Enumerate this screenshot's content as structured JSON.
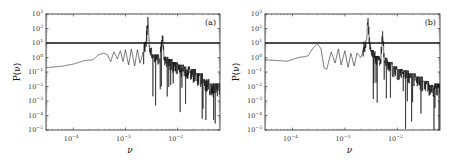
{
  "chart_data": [
    {
      "type": "line",
      "panel_label": "(a)",
      "title": "",
      "xlabel": "ν",
      "ylabel": "P(ν)",
      "xscale": "log",
      "yscale": "log",
      "xlim": [
        3e-05,
        0.065
      ],
      "ylim": [
        1e-05,
        1000.0
      ],
      "x_ticks": [
        "10^-4",
        "10^-3",
        "10^-2"
      ],
      "y_ticks": [
        "10^3",
        "10^2",
        "10^1",
        "10^0",
        "10^-1",
        "10^-2",
        "10^-3",
        "10^-4",
        "10^-5"
      ],
      "threshold_line": 10,
      "frame": {
        "left": 46,
        "right": 220,
        "top": 14,
        "bottom": 130
      },
      "series": [
        {
          "name": "power spectrum",
          "x": [
            3e-05,
            6e-05,
            0.0001,
            0.00016,
            0.00024,
            0.0003,
            0.00038,
            0.00045,
            0.00052,
            0.0006,
            0.0007,
            0.0008,
            0.0009,
            0.001,
            0.00115,
            0.0013,
            0.0015,
            0.0017,
            0.0019,
            0.0022,
            0.0025,
            0.0027,
            0.00285,
            0.003,
            0.0033,
            0.0038,
            0.0045,
            0.0052,
            0.0055,
            0.0065,
            0.008,
            0.01,
            0.013,
            0.017,
            0.022,
            0.03,
            0.04,
            0.05,
            0.065
          ],
          "values": [
            0.2,
            0.25,
            0.35,
            0.6,
            0.7,
            1.5,
            2.0,
            1.6,
            0.5,
            2.5,
            0.8,
            3.0,
            0.5,
            3.5,
            0.3,
            4.0,
            0.25,
            3.5,
            0.4,
            2.5,
            8.0,
            400,
            6.0,
            3.0,
            0.8,
            1.0,
            0.6,
            20,
            0.7,
            0.5,
            0.3,
            0.2,
            0.15,
            0.1,
            0.05,
            0.02,
            0.01,
            0.005,
            0.01
          ]
        }
      ]
    },
    {
      "type": "line",
      "panel_label": "(b)",
      "title": "",
      "xlabel": "ν",
      "ylabel": "P(ν)",
      "xscale": "log",
      "yscale": "log",
      "xlim": [
        3e-05,
        0.065
      ],
      "ylim": [
        1e-05,
        1000.0
      ],
      "x_ticks": [
        "10^-4",
        "10^-3",
        "10^-2"
      ],
      "y_ticks": [
        "10^3",
        "10^2",
        "10^1",
        "10^0",
        "10^-1",
        "10^-2",
        "10^-3",
        "10^-4",
        "10^-5"
      ],
      "threshold_line": 10,
      "frame": {
        "left": 265,
        "right": 440,
        "top": 14,
        "bottom": 130
      },
      "series": [
        {
          "name": "power spectrum",
          "x": [
            3e-05,
            8e-05,
            0.00013,
            0.00016,
            0.0002,
            0.00024,
            0.0003,
            0.00035,
            0.0004,
            0.00045,
            0.00055,
            0.00065,
            0.00075,
            0.00085,
            0.001,
            0.00115,
            0.0013,
            0.0015,
            0.0017,
            0.002,
            0.0023,
            0.0026,
            0.00275,
            0.0029,
            0.0032,
            0.0038,
            0.0048,
            0.0053,
            0.0056,
            0.0065,
            0.008,
            0.01,
            0.013,
            0.017,
            0.022,
            0.03,
            0.04,
            0.05,
            0.065
          ],
          "values": [
            0.7,
            0.55,
            1.0,
            1.1,
            1.3,
            4.0,
            9.0,
            4.0,
            0.2,
            0.15,
            2.5,
            0.4,
            4.0,
            0.3,
            3.0,
            0.2,
            2.0,
            0.25,
            2.0,
            1.0,
            3.0,
            10,
            500,
            15,
            2.0,
            0.8,
            0.5,
            40,
            0.6,
            0.3,
            0.15,
            0.1,
            0.08,
            0.05,
            0.03,
            0.015,
            0.008,
            0.006,
            0.01
          ]
        }
      ]
    }
  ],
  "ui": {
    "panel_a_label": "(a)",
    "panel_b_label": "(b)",
    "xlabel": "ν",
    "ylabel": "P(ν)"
  }
}
